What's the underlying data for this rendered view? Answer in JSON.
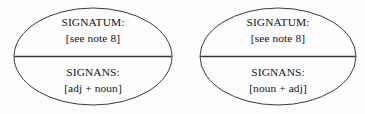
{
  "figure": {
    "name": "semiotic-sign-diagram",
    "background_color": "#fdfdfd",
    "stroke_color": "#3a3a3a",
    "text_color": "#141414",
    "shape": "ellipse-divided-horizontally"
  },
  "diagrams": [
    {
      "id": "left-sign",
      "upper": {
        "label": "SIGNATUM:",
        "value": "[see note 8]"
      },
      "lower": {
        "label": "SIGNANS:",
        "value": "[adj + noun]"
      }
    },
    {
      "id": "right-sign",
      "upper": {
        "label": "SIGNATUM:",
        "value": "[see note 8]"
      },
      "lower": {
        "label": "SIGNANS:",
        "value": "[noun + adj]"
      }
    }
  ]
}
